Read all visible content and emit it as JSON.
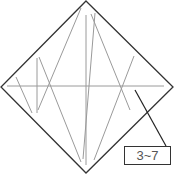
{
  "diagram": {
    "type": "origami-crease-pattern",
    "outline": {
      "shape": "diamond",
      "color": "#333333",
      "points": [
        [
          86,
          1
        ],
        [
          173,
          87
        ],
        [
          86,
          173
        ],
        [
          1,
          87
        ]
      ]
    },
    "crease_color": "#9a9a9a",
    "creases": [
      [
        [
          7,
          86
        ],
        [
          164,
          86
        ]
      ],
      [
        [
          86,
          15
        ],
        [
          86,
          165
        ]
      ],
      [
        [
          81,
          8
        ],
        [
          38,
          110
        ]
      ],
      [
        [
          37,
          58
        ],
        [
          37,
          113
        ]
      ],
      [
        [
          16,
          77
        ],
        [
          32,
          113
        ]
      ],
      [
        [
          39,
          57
        ],
        [
          81,
          162
        ]
      ],
      [
        [
          91,
          14
        ],
        [
          130,
          110
        ]
      ],
      [
        [
          95,
          13
        ],
        [
          83,
          159
        ]
      ],
      [
        [
          134,
          56
        ],
        [
          94,
          160
        ]
      ]
    ],
    "callout": {
      "label": "3~7",
      "leader_from": [
        135,
        90
      ],
      "leader_to": [
        166,
        146
      ]
    }
  }
}
